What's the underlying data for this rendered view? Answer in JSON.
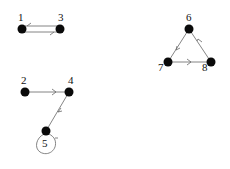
{
  "diagram": {
    "type": "directed-graph",
    "nodes": [
      {
        "id": "1",
        "label": "1",
        "x": 22,
        "y": 29
      },
      {
        "id": "3",
        "label": "3",
        "x": 60,
        "y": 29
      },
      {
        "id": "2",
        "label": "2",
        "x": 25,
        "y": 92
      },
      {
        "id": "4",
        "label": "4",
        "x": 69,
        "y": 92
      },
      {
        "id": "5",
        "label": "5",
        "x": 46,
        "y": 131
      },
      {
        "id": "6",
        "label": "6",
        "x": 189,
        "y": 29
      },
      {
        "id": "7",
        "label": "7",
        "x": 168,
        "y": 62
      },
      {
        "id": "8",
        "label": "8",
        "x": 211,
        "y": 62
      }
    ],
    "edges": [
      {
        "from": "3",
        "to": "1"
      },
      {
        "from": "1",
        "to": "3"
      },
      {
        "from": "2",
        "to": "4"
      },
      {
        "from": "4",
        "to": "5"
      },
      {
        "from": "5",
        "to": "5"
      },
      {
        "from": "6",
        "to": "7"
      },
      {
        "from": "7",
        "to": "8"
      },
      {
        "from": "8",
        "to": "6"
      }
    ]
  },
  "labels": {
    "n1": "1",
    "n2": "2",
    "n3": "3",
    "n4": "4",
    "n5": "5",
    "n6": "6",
    "n7": "7",
    "n8": "8"
  }
}
